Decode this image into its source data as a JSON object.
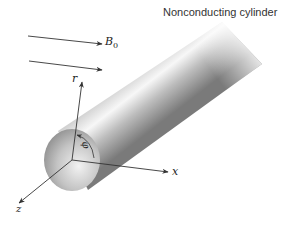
{
  "diagram": {
    "title": "Nonconducting cylinder",
    "field": {
      "label": "B",
      "subscript": "0",
      "arrow_count": 2,
      "direction": "right"
    },
    "axes": {
      "r": "r",
      "x": "x",
      "z": "z"
    },
    "angle_label": "φ",
    "colors": {
      "line": "#333333",
      "shade_dark": "#6f6f6f",
      "shade_light": "#dcdcdc",
      "background": "#ffffff"
    }
  }
}
